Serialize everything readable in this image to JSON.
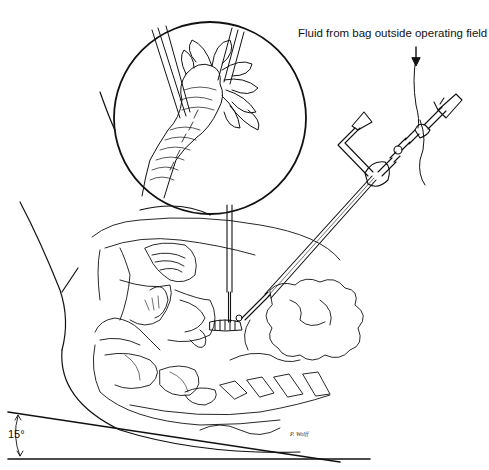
{
  "figure": {
    "labels": {
      "fluid_source": "Fluid from bag outside operating field",
      "table_angle": "15°",
      "artist_signature": "P. Wolff"
    },
    "elements": {
      "magnified_inset": "circular detail view of grasped structure with instruments",
      "instrument_vertical": "straight probe entering vertically",
      "instrument_diagonal": "irrigation/suction cannula with trumpet valves",
      "fluid_line": "tubing with downward arrow from bag",
      "tilt_indicator": "angle arrow between table lines"
    },
    "colors": {
      "line": "#111111",
      "background": "#ffffff"
    }
  }
}
